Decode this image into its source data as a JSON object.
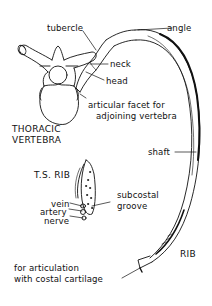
{
  "diagram": {
    "labels": {
      "tubercle": "tubercle",
      "angle": "angle",
      "neck": "neck",
      "head": "head",
      "facet_line1": "articular facet for",
      "facet_line2": "adjoining vertebra",
      "vertebra_line1": "THORACIC",
      "vertebra_line2": "VERTEBRA",
      "ts_rib": "T.S. RIB",
      "subcostal_line1": "subcostal",
      "subcostal_line2": "groove",
      "vein": "vein",
      "artery": "artery",
      "nerve": "nerve",
      "shaft": "shaft",
      "rib": "RIB",
      "articulation_line1": "for articulation",
      "articulation_line2": "with costal cartilage"
    },
    "colors": {
      "ink": "#111111",
      "background": "#ffffff"
    }
  }
}
